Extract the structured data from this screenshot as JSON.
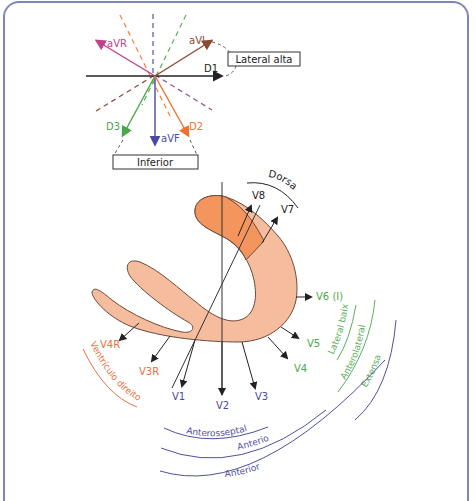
{
  "colors": {
    "frame": "#7d86b8",
    "black": "#222222",
    "avr": "#c0428a",
    "avl": "#8b4a32",
    "avf": "#4a4aa0",
    "d2": "#f07030",
    "d3": "#4aa84a",
    "dash_orange": "#f08040",
    "dash_blue": "#5050b0",
    "dash_green": "#5ab05a",
    "dash_purple": "#9a4a8a",
    "dash_brown": "#8b4a32",
    "heart_light": "#f6bc9e",
    "heart_dark": "#f4955e",
    "rv_label": "#e87040",
    "lateral_green": "#5ab05a",
    "anterior_purple": "#5050a0"
  },
  "frontal": {
    "leads": {
      "avr": "aVR",
      "avl": "aVL",
      "d1": "D1",
      "d2": "D2",
      "d3": "D3",
      "avf": "aVF"
    },
    "boxes": {
      "lateral_alta": "Lateral alta",
      "inferior": "Inferior"
    }
  },
  "horizontal": {
    "leads": {
      "v1": "V1",
      "v2": "V2",
      "v3": "V3",
      "v4": "V4",
      "v5": "V5",
      "v6": "V6 (I)",
      "v7": "V7",
      "v8": "V8",
      "v3r": "V3R",
      "v4r": "V4R"
    },
    "regions": {
      "dorsal": "Dorsal",
      "lateral_baixa": "Lateral baixa",
      "anterolateral": "Anterolateral",
      "extensa": "Extensa",
      "anterosseptal": "Anterosseptal",
      "anterior_1": "Anterior",
      "anterior_2": "Anterior",
      "ventriculo_direito": "Ventrículo direito"
    }
  }
}
